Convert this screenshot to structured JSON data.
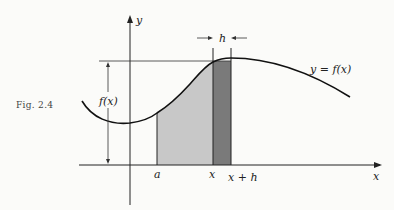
{
  "figure": {
    "caption": "Fig. 2.4",
    "labels": {
      "y_axis": "y",
      "x_axis": "x",
      "curve": "y = f(x)",
      "height": "f(x)",
      "a": "a",
      "x": "x",
      "x_plus_h": "x + h",
      "h": "h"
    },
    "colors": {
      "light_shade": "#c8c8c8",
      "dark_shade": "#7a7a7a",
      "ink": "#222222"
    }
  }
}
